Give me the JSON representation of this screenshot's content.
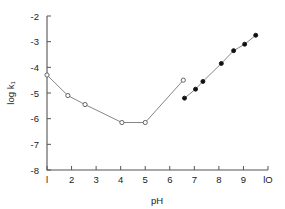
{
  "chart_data": {
    "type": "line",
    "title": "",
    "subtitle": "",
    "xlabel": "pH",
    "ylabel": "log k₁",
    "xlim": [
      1,
      10
    ],
    "ylim": [
      -8,
      -2
    ],
    "xticks": [
      1,
      2,
      3,
      4,
      5,
      6,
      7,
      8,
      9,
      10
    ],
    "xtick_labels": [
      "l",
      "2",
      "3",
      "4",
      "5",
      "6",
      "7",
      "8",
      "9",
      "lO"
    ],
    "yticks": [
      -2,
      -3,
      -4,
      -5,
      -6,
      -7,
      -8
    ],
    "ytick_labels": [
      "-2",
      "-3",
      "-4",
      "-5",
      "-6",
      "-7",
      "-8"
    ],
    "grid": false,
    "legend": "none",
    "annotations": [],
    "series": [
      {
        "name": "open-circle-branch",
        "marker": "open-circle",
        "line": true,
        "points": [
          {
            "x": 1.0,
            "y": -4.3
          },
          {
            "x": 1.85,
            "y": -5.1
          },
          {
            "x": 2.55,
            "y": -5.45
          },
          {
            "x": 4.05,
            "y": -6.15
          },
          {
            "x": 5.0,
            "y": -6.15
          },
          {
            "x": 6.55,
            "y": -4.5
          }
        ]
      },
      {
        "name": "filled-circle-branch",
        "marker": "filled-circle",
        "line": true,
        "points": [
          {
            "x": 6.6,
            "y": -5.2
          },
          {
            "x": 7.05,
            "y": -4.85
          },
          {
            "x": 7.35,
            "y": -4.55
          },
          {
            "x": 8.1,
            "y": -3.85
          },
          {
            "x": 8.6,
            "y": -3.35
          },
          {
            "x": 9.05,
            "y": -3.1
          },
          {
            "x": 9.5,
            "y": -2.75
          }
        ]
      }
    ],
    "colors": {
      "axis": "#555555",
      "line": "#777777",
      "open_marker_fill": "#ffffff",
      "filled_marker_fill": "#111111",
      "text": "#1a1a1a",
      "background": "#ffffff"
    }
  }
}
